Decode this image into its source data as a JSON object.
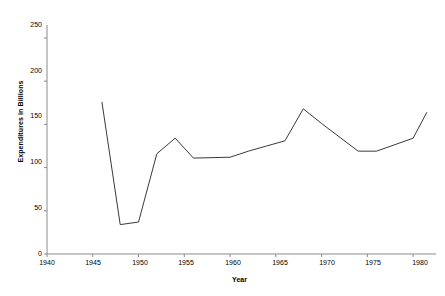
{
  "chart_data": {
    "type": "line",
    "title": "",
    "xlabel": "Year",
    "ylabel": "Expenditures in Billions",
    "xlim": [
      1940,
      1982.5
    ],
    "ylim": [
      0,
      265
    ],
    "grid": false,
    "legend": null,
    "xticks": [
      1940,
      1945,
      1950,
      1955,
      1960,
      1965,
      1970,
      1975,
      1980
    ],
    "xtick_labels": [
      "1940",
      "1945",
      "1950",
      "1955",
      "1960",
      "1965",
      "1970",
      "1975",
      "1980"
    ],
    "yticks": [
      0,
      50,
      100,
      150,
      200,
      250
    ],
    "ytick_labels": [
      "0",
      "50",
      "100",
      "150",
      "200",
      "250"
    ],
    "series": [
      {
        "name": "Expenditures",
        "color": "#3a3a3a",
        "x": [
          1946,
          1948,
          1950,
          1952,
          1954,
          1956,
          1960,
          1962,
          1964,
          1966,
          1968,
          1970,
          1974,
          1976,
          1980,
          1981.5
        ],
        "y": [
          176,
          34,
          37,
          116,
          134,
          111,
          112,
          119,
          125,
          131,
          168,
          151,
          119,
          119,
          134,
          164
        ]
      }
    ]
  }
}
